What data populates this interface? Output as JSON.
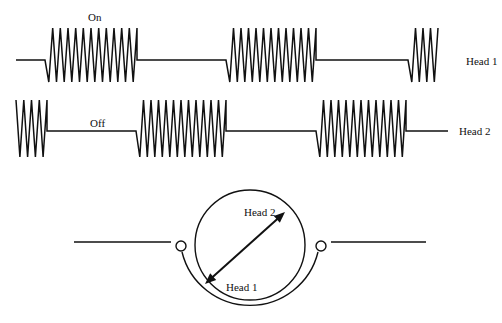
{
  "colors": {
    "ink": "#111111",
    "background": "#ffffff"
  },
  "waveforms": [
    {
      "name": "head-1",
      "label": "Head 1",
      "baseline_y": 60,
      "peak_y": 28,
      "trough_y": 82,
      "x_start": 16,
      "x_end": 440,
      "bursts": [
        {
          "x0": 45,
          "x1": 137,
          "cycles": 12
        },
        {
          "x0": 226,
          "x1": 316,
          "cycles": 12
        },
        {
          "x0": 408,
          "x1": 438,
          "cycles": 4
        }
      ],
      "annotation": {
        "text": "On",
        "x": 88,
        "y": 21
      },
      "label_pos": {
        "x": 466,
        "y": 65
      }
    },
    {
      "name": "head-2",
      "label": "Head 2",
      "baseline_y": 131,
      "peak_y": 100,
      "trough_y": 157,
      "x_start": 16,
      "x_end": 448,
      "bursts": [
        {
          "x0": 16,
          "x1": 47,
          "cycles": 4
        },
        {
          "x0": 136,
          "x1": 226,
          "cycles": 12
        },
        {
          "x0": 316,
          "x1": 406,
          "cycles": 12
        }
      ],
      "annotation": {
        "text": "Off",
        "x": 90,
        "y": 127
      },
      "label_pos": {
        "x": 459,
        "y": 135
      }
    }
  ],
  "drum": {
    "cx": 250,
    "cy": 245,
    "r": 55,
    "guide_r": 70,
    "roller_r": 5,
    "tape_y": 242,
    "tape_left": [
      74,
      176
    ],
    "tape_right": [
      326,
      426
    ],
    "head_labels": {
      "head2": {
        "text": "Head 2",
        "x": 244,
        "y": 216
      },
      "head1": {
        "text": "Head 1",
        "x": 226,
        "y": 291
      }
    }
  },
  "labels": {
    "on": "On",
    "off": "Off",
    "head1": "Head 1",
    "head2": "Head 2"
  }
}
